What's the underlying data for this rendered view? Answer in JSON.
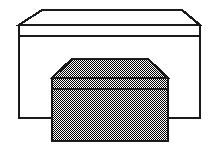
{
  "figure": {
    "name": "two-stacked-boxes-illustration",
    "canvas": {
      "width": 218,
      "height": 156
    },
    "background_color": "#ffffff",
    "stroke_color": "#1a1a1a",
    "fill_white": "#ffffff",
    "halftone_dark": "#000000",
    "halftone_light": "#ffffff",
    "halftone_average": "#808080",
    "objects": [
      {
        "id": "back-box",
        "label": "back-box",
        "fill": "#ffffff",
        "stroke_width": 2.2,
        "lid_top_polygon": "42,10 182,10 200,25 19,25",
        "lid_line_y": 36,
        "body_polygon": "19,25 200,25 200,118 19,118",
        "left_x": 19,
        "right_x": 200,
        "top_y": 25,
        "bottom_y": 118,
        "apex_left_x": 42,
        "apex_right_x": 182,
        "apex_y": 10
      },
      {
        "id": "front-box",
        "label": "front-box",
        "fill": "halftone",
        "stroke_width": 2.4,
        "lid_top_polygon": "72,59 148,59 168,78 52,78",
        "lid_line_y": 89,
        "body_polygon": "52,78 168,78 168,141 52,141",
        "left_x": 52,
        "right_x": 168,
        "top_y": 78,
        "bottom_y": 141,
        "apex_left_x": 72,
        "apex_right_x": 148,
        "apex_y": 59
      }
    ]
  }
}
